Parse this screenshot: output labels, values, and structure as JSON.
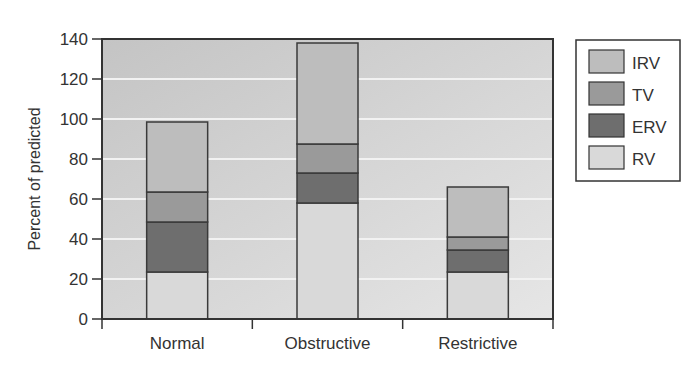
{
  "chart_data": {
    "type": "bar",
    "stacked": true,
    "title": "",
    "xlabel": "",
    "ylabel": "Percent of predicted",
    "ylim": [
      0,
      140
    ],
    "yticks": [
      0,
      20,
      40,
      60,
      80,
      100,
      120,
      140
    ],
    "grid": true,
    "legend_position": "right",
    "categories": [
      "Normal",
      "Obstructive",
      "Restrictive"
    ],
    "series": [
      {
        "name": "RV",
        "color": "#d9d9d9",
        "values": [
          23.5,
          58,
          23.5
        ]
      },
      {
        "name": "ERV",
        "color": "#6e6e6e",
        "values": [
          25,
          15,
          11
        ]
      },
      {
        "name": "TV",
        "color": "#9a9a9a",
        "values": [
          15,
          14.5,
          6.5
        ]
      },
      {
        "name": "IRV",
        "color": "#bdbdbd",
        "values": [
          35,
          50.5,
          25
        ]
      }
    ],
    "totals": [
      98.5,
      138,
      66
    ],
    "legend_order": [
      "IRV",
      "TV",
      "ERV",
      "RV"
    ]
  },
  "colors": {
    "plot_background": "#c8c8c8",
    "gridline": "#f2f2f2",
    "axis": "#333333",
    "bar_outline": "#3a3a3a"
  }
}
